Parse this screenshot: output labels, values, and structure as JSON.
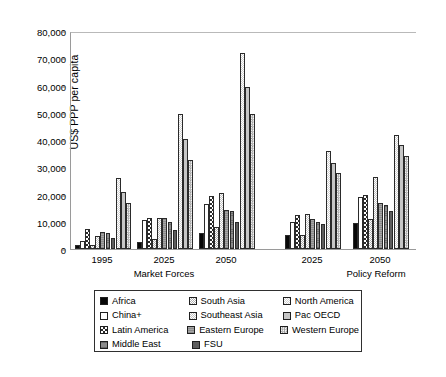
{
  "chart_data": {
    "type": "bar",
    "title": "",
    "xlabel": "",
    "ylabel": "US$ PPP per capita",
    "ylim": [
      0,
      80000
    ],
    "ytick_labels": [
      "0",
      "10,000",
      "20,000",
      "30,000",
      "40,000",
      "50,000",
      "60,000",
      "70,000",
      "80,000"
    ],
    "ytick_values": [
      0,
      10000,
      20000,
      30000,
      40000,
      50000,
      60000,
      70000,
      80000
    ],
    "grid": false,
    "legend_position": "bottom",
    "categories": [
      "1995",
      "2025",
      "2050",
      "2025",
      "2050"
    ],
    "scenario_labels": [
      "Market Forces",
      "Policy Reform"
    ],
    "scenario_groups": [
      {
        "label": "Market Forces",
        "categories": [
          "1995",
          "2025",
          "2050"
        ]
      },
      {
        "label": "Policy Reform",
        "categories": [
          "2025",
          "2050"
        ]
      }
    ],
    "series": [
      {
        "name": "Africa",
        "pattern": "solid-black",
        "color": "#000000",
        "values": [
          1500,
          2700,
          6000,
          5000,
          9500
        ]
      },
      {
        "name": "China+",
        "pattern": "white",
        "color": "#ffffff",
        "values": [
          3000,
          10500,
          16500,
          10000,
          19000
        ]
      },
      {
        "name": "Latin America",
        "pattern": "checker",
        "color": "#3a3a3a",
        "values": [
          7200,
          11500,
          19500,
          12500,
          20000
        ]
      },
      {
        "name": "South Asia",
        "pattern": "dots-light",
        "color": "#c9c9c9",
        "values": [
          1500,
          3500,
          8000,
          5000,
          11000
        ]
      },
      {
        "name": "Southeast Asia",
        "pattern": "dots-pale",
        "color": "#dcdcdc",
        "values": [
          4800,
          11500,
          20500,
          13000,
          26500
        ]
      },
      {
        "name": "Eastern Europe",
        "pattern": "grey-mid",
        "color": "#9a9a9a",
        "values": [
          6200,
          11500,
          14500,
          11000,
          17000
        ]
      },
      {
        "name": "Middle East",
        "pattern": "grey-dark",
        "color": "#777777",
        "values": [
          6000,
          10000,
          14000,
          10000,
          16000
        ]
      },
      {
        "name": "FSU",
        "pattern": "solid-grey",
        "color": "#5c5c5c",
        "values": [
          4000,
          7000,
          10000,
          9000,
          14000
        ]
      },
      {
        "name": "North America",
        "pattern": "dots-vlight",
        "color": "#e8e8e8",
        "values": [
          26000,
          49500,
          72000,
          36000,
          42000
        ]
      },
      {
        "name": "Pac OECD",
        "pattern": "grey-light",
        "color": "#bfbfbf",
        "values": [
          21000,
          40500,
          59500,
          31500,
          38000
        ]
      },
      {
        "name": "Western Europe",
        "pattern": "checker-fine",
        "color": "#b2b2b2",
        "values": [
          17000,
          32500,
          49500,
          28000,
          34000
        ]
      }
    ],
    "legend": [
      [
        {
          "name": "Africa",
          "pattern": "solid-black"
        },
        {
          "name": "South Asia",
          "pattern": "dots-light"
        },
        {
          "name": "North America",
          "pattern": "dots-vlight"
        }
      ],
      [
        {
          "name": "China+",
          "pattern": "white"
        },
        {
          "name": "Southeast Asia",
          "pattern": "dots-pale"
        },
        {
          "name": "Pac OECD",
          "pattern": "grey-light"
        }
      ],
      [
        {
          "name": "Latin America",
          "pattern": "checker"
        },
        {
          "name": "Eastern Europe",
          "pattern": "grey-mid"
        },
        {
          "name": "Western Europe",
          "pattern": "checker-fine"
        }
      ],
      [
        {
          "name": "Middle East",
          "pattern": "grey-dark"
        },
        {
          "name": "FSU",
          "pattern": "solid-grey"
        }
      ]
    ]
  }
}
